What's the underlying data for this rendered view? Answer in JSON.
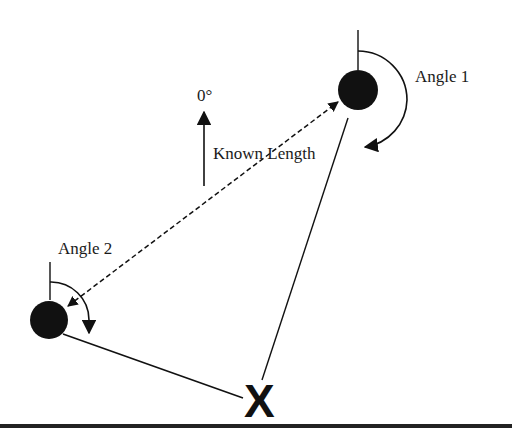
{
  "diagram": {
    "type": "triangulation",
    "colors": {
      "ink": "#111111",
      "background": "#ffffff"
    },
    "labels": {
      "angle1": "Angle 1",
      "angle2": "Angle 2",
      "north": "0°",
      "baseline": "Known Length",
      "target": "X"
    },
    "nodes": [
      {
        "id": "station-1",
        "cx": 358,
        "cy": 90,
        "r": 20
      },
      {
        "id": "station-2",
        "cx": 49,
        "cy": 320,
        "r": 19
      }
    ],
    "edges": [
      {
        "from": "station-2",
        "to": "station-1",
        "style": "dashed",
        "arrows": "both",
        "label": "Known Length"
      },
      {
        "from": "station-1",
        "to": "target",
        "style": "solid"
      },
      {
        "from": "station-2",
        "to": "target",
        "style": "solid"
      }
    ]
  }
}
